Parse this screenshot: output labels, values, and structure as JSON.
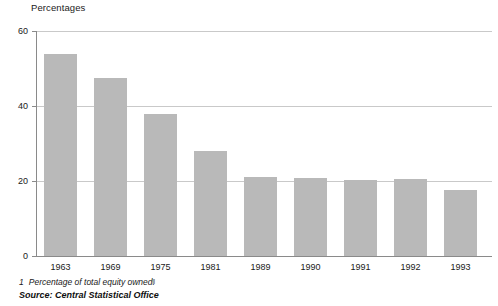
{
  "chart_data": {
    "type": "bar",
    "title": "Percentages",
    "xlabel": "",
    "ylabel": "",
    "categories": [
      "1963",
      "1969",
      "1975",
      "1981",
      "1989",
      "1990",
      "1991",
      "1992",
      "1993"
    ],
    "values": [
      54,
      47.5,
      38,
      28,
      21,
      20.7,
      20.2,
      20.6,
      17.6
    ],
    "series": [
      {
        "name": "Percentage of total equity owned",
        "values": [
          54,
          47.5,
          38,
          28,
          21,
          20.7,
          20.2,
          20.6,
          17.6
        ]
      }
    ],
    "ylim": [
      0,
      60
    ],
    "yticks": [
      0,
      20,
      40,
      60
    ],
    "ytick_labels": [
      "0",
      "20",
      "40",
      "60"
    ],
    "grid": true,
    "legend": "none",
    "bar_color": "#b9b9b9",
    "axis_color": "#8a8a8a",
    "grid_color": "#c9c9c9"
  },
  "footnote": {
    "marker": "1",
    "text": "Percentage of total equity owned.",
    "artifact": "‖"
  },
  "source": {
    "text": "Source: Central Statistical Office"
  }
}
